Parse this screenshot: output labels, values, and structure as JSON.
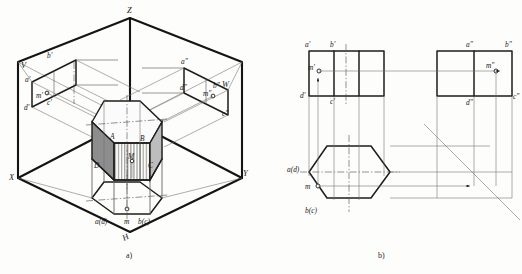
{
  "figure": {
    "captions": {
      "left": "a)",
      "right": "b)"
    }
  },
  "pictorial": {
    "name": "three-plane-projection-pictorial",
    "axes": {
      "z": "Z",
      "x": "X",
      "y": "Y"
    },
    "planes": {
      "v": "V",
      "w": "W",
      "h": "H"
    },
    "v_plane_labels": {
      "a_prime": "a'",
      "b_prime": "b'",
      "m_prime": "m'",
      "d_prime": "d'",
      "c_prime": "c'"
    },
    "w_plane_labels": {
      "a_dprime": "a\"",
      "d_dprime": "d\"",
      "b_dprime": "b\"",
      "w_mark": "W",
      "m_dprime": "m\"",
      "c_dprime": "c\""
    },
    "h_plane_labels": {
      "ad": "a(d)",
      "m": "m",
      "bc": "b(c)"
    },
    "solid_vertices": {
      "A": "A",
      "B": "B",
      "C": "C",
      "D": "D",
      "M": "M"
    }
  },
  "orthographic": {
    "name": "three-view-orthographic-layout",
    "front_view": {
      "label": "front-view",
      "corner_labels": {
        "top_left": "a'",
        "top_right": "b'",
        "bottom_left": "d'",
        "bottom_right": "c'"
      },
      "point_label": "m'"
    },
    "side_view": {
      "label": "left-side-view",
      "corner_labels": {
        "top_left": "a\"",
        "top_right": "b\"",
        "bottom_left": "d\"",
        "bottom_right": "c\""
      },
      "point_label": "m\""
    },
    "top_view": {
      "label": "top-view-hexagon",
      "corner_labels": {
        "left": "a(d)",
        "bottom": "b(c)"
      },
      "point_label": "m"
    },
    "miter_line": "45-degree-miter-line"
  },
  "colors": {
    "line": "#1d1d1d",
    "thin_line": "#555555",
    "center_line": "#4a4a4a",
    "shade_dark": "#8d8d8d",
    "shade_mid": "#bdbdbd",
    "shade_light": "#f2f2f2",
    "background": "#fdfdfb"
  }
}
